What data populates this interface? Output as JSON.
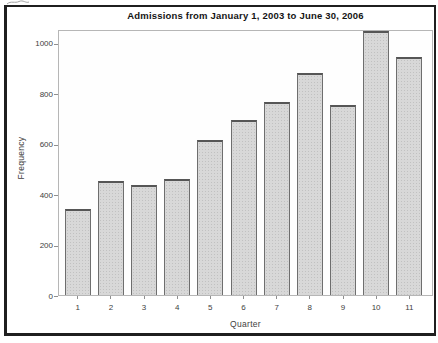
{
  "figure": {
    "background": "#ffffff",
    "frame_color": "#1f1f1f"
  },
  "chart_data": {
    "type": "bar",
    "title": "Admissions from January 1, 2003 to June 30, 2006",
    "xlabel": "Quarter",
    "ylabel": "Frequency",
    "categories": [
      "1",
      "2",
      "3",
      "4",
      "5",
      "6",
      "7",
      "8",
      "9",
      "10",
      "11"
    ],
    "values": [
      340,
      450,
      435,
      460,
      615,
      695,
      765,
      880,
      755,
      1045,
      945
    ],
    "y_ticks": [
      0,
      200,
      400,
      600,
      800,
      1000
    ],
    "ylim": [
      0,
      1050
    ],
    "grid": false,
    "legend": "none",
    "bar_fill": "#d8d8d8",
    "bar_border": "#6e6e6e",
    "plot_border": "#b6b6b6",
    "axis_text_color": "#3e3e3e",
    "title_color": "#141414"
  }
}
